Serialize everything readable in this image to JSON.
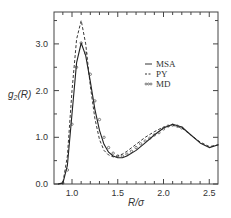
{
  "chart_data": {
    "type": "line",
    "title": "",
    "xlabel": "R/σ",
    "ylabel": "g2(R)",
    "xlim": [
      0.8,
      2.6
    ],
    "ylim": [
      0.0,
      3.7
    ],
    "xticks": [
      "1.0",
      "1.5",
      "2.0",
      "2.5"
    ],
    "yticks": [
      "0.0",
      "1.0",
      "2.0",
      "3.0"
    ],
    "grid": false,
    "legend_position": "upper right",
    "legend": [
      "MSA",
      "PY",
      "MD"
    ],
    "series": [
      {
        "name": "MSA",
        "style": "solid",
        "x": [
          0.85,
          0.9,
          0.95,
          1.0,
          1.05,
          1.1,
          1.15,
          1.2,
          1.25,
          1.3,
          1.35,
          1.4,
          1.45,
          1.5,
          1.55,
          1.6,
          1.7,
          1.8,
          1.9,
          2.0,
          2.1,
          2.2,
          2.3,
          2.4,
          2.5,
          2.6
        ],
        "y": [
          0.0,
          0.02,
          0.4,
          1.5,
          2.6,
          3.02,
          2.75,
          2.2,
          1.6,
          1.15,
          0.85,
          0.68,
          0.6,
          0.56,
          0.56,
          0.6,
          0.72,
          0.88,
          1.05,
          1.2,
          1.28,
          1.22,
          1.05,
          0.88,
          0.78,
          0.84
        ]
      },
      {
        "name": "PY",
        "style": "dashed",
        "x": [
          0.85,
          0.9,
          0.95,
          1.0,
          1.05,
          1.1,
          1.15,
          1.2,
          1.25,
          1.3,
          1.35,
          1.4,
          1.45,
          1.5,
          1.55,
          1.6,
          1.7,
          1.8,
          1.9,
          2.0,
          2.1,
          2.2,
          2.3,
          2.4,
          2.5,
          2.6
        ],
        "y": [
          0.0,
          0.03,
          0.6,
          2.0,
          3.1,
          3.5,
          3.0,
          2.1,
          1.4,
          0.95,
          0.72,
          0.62,
          0.58,
          0.6,
          0.64,
          0.7,
          0.85,
          1.0,
          1.12,
          1.22,
          1.26,
          1.2,
          1.05,
          0.9,
          0.8,
          0.84
        ]
      },
      {
        "name": "MD",
        "style": "markers",
        "x": [
          0.9,
          0.95,
          1.0,
          1.05,
          1.1,
          1.15,
          1.2,
          1.25,
          1.3,
          1.35,
          1.4,
          1.45,
          1.5,
          1.55,
          1.6,
          1.65,
          1.7,
          1.75,
          1.8,
          1.85,
          1.9,
          1.95,
          2.0,
          2.05,
          2.1,
          2.15,
          2.2
        ],
        "y": [
          0.02,
          0.3,
          1.28,
          2.5,
          3.02,
          2.8,
          2.35,
          1.78,
          1.38,
          1.0,
          0.78,
          0.66,
          0.6,
          0.6,
          0.64,
          0.7,
          0.78,
          0.86,
          0.92,
          0.98,
          1.05,
          1.1,
          1.18,
          1.24,
          1.26,
          1.24,
          1.2
        ]
      }
    ]
  }
}
